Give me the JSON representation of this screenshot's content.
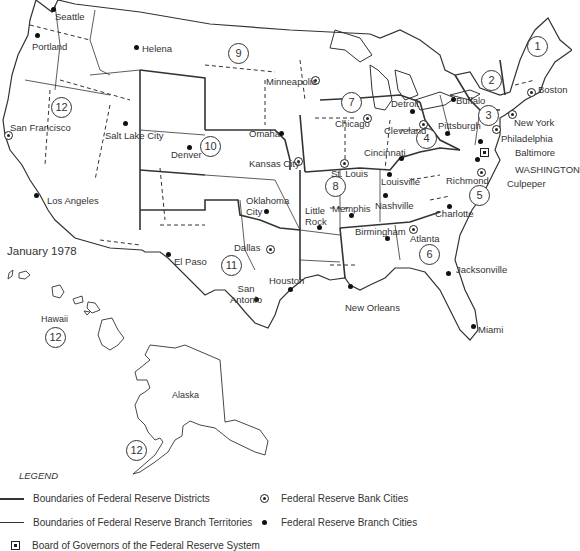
{
  "map": {
    "title": "January 1978",
    "cities": {
      "seattle": "Seattle",
      "portland": "Portland",
      "helena": "Helena",
      "minneapolis": "Minneapolis",
      "san_francisco": "San Francisco",
      "salt_lake_city": "Salt Lake City",
      "denver": "Denver",
      "omaha": "Omaha",
      "kansas_city": "Kansas City",
      "los_angeles": "Los Angeles",
      "oklahoma_city": "Oklahoma City",
      "el_paso": "El Paso",
      "dallas": "Dallas",
      "houston": "Houston",
      "san_antonio": "San Antonio",
      "chicago": "Chicago",
      "detroit": "Detroit",
      "cleveland": "Cleveland",
      "cincinnati": "Cincinnati",
      "pittsburgh": "Pittsburgh",
      "buffalo": "Buffalo",
      "boston": "Boston",
      "new_york": "New York",
      "philadelphia": "Philadelphia",
      "baltimore": "Baltimore",
      "washington": "WASHINGTON",
      "richmond": "Richmond",
      "culpeper": "Culpeper",
      "charlotte": "Charlotte",
      "st_louis": "St. Louis",
      "louisville": "Louisville",
      "nashville": "Nashville",
      "memphis": "Memphis",
      "little_rock": "Little Rock",
      "birmingham": "Birmingham",
      "atlanta": "Atlanta",
      "jacksonville": "Jacksonville",
      "new_orleans": "New Orleans",
      "miami": "Miami"
    },
    "regions": {
      "hawaii": "Hawaii",
      "alaska": "Alaska"
    },
    "districts": [
      "1",
      "2",
      "3",
      "4",
      "5",
      "6",
      "7",
      "8",
      "9",
      "10",
      "11",
      "12"
    ]
  },
  "legend": {
    "title": "LEGEND",
    "district_boundaries": "Boundaries of Federal Reserve Districts",
    "branch_boundaries": "Boundaries of Federal Reserve Branch Territories",
    "bank_cities": "Federal Reserve Bank Cities",
    "branch_cities": "Federal Reserve Branch Cities",
    "board": "Board of Governors of the Federal Reserve System"
  }
}
